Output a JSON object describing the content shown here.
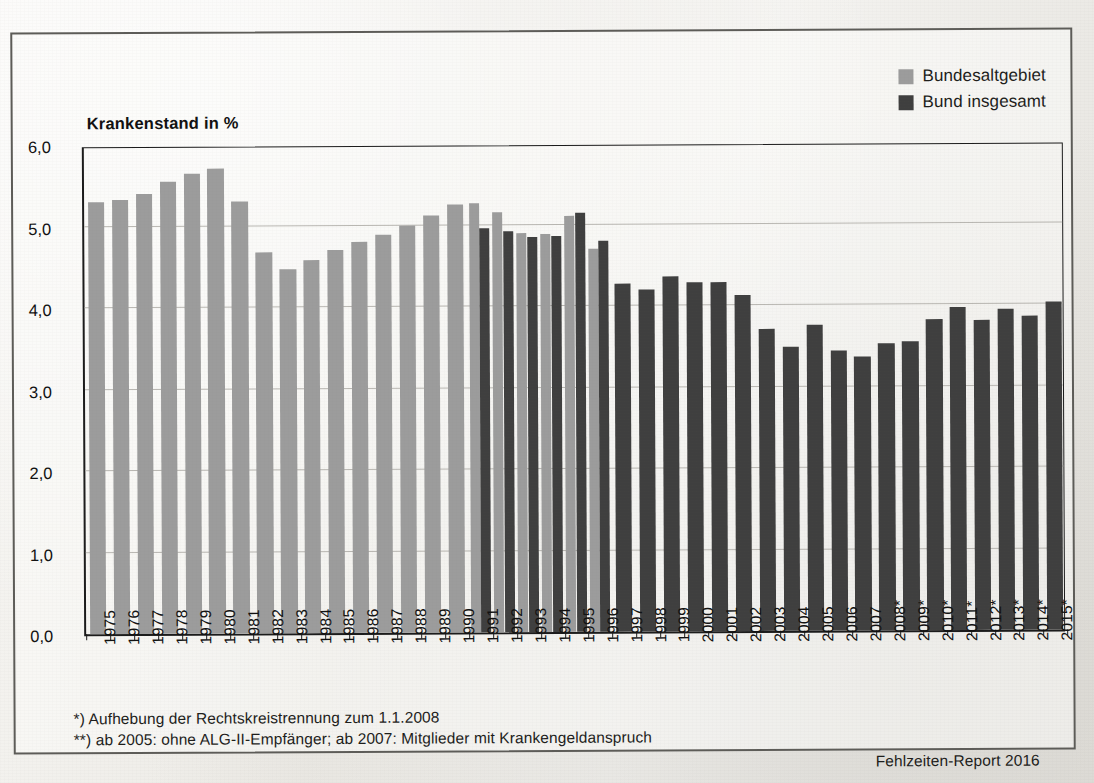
{
  "legend": {
    "items": [
      {
        "label": "Bundesaltgebiet",
        "color": "#9c9c9c"
      },
      {
        "label": "Bund insgesamt",
        "color": "#3f3f3f"
      }
    ]
  },
  "notes": [
    "*) Aufhebung der Rechtskreistrennung zum 1.1.2008",
    "**) ab 2005: ohne ALG-II-Empfänger; ab 2007: Mitglieder mit Krankengeldanspruch"
  ],
  "source": "Fehlzeiten-Report 2016",
  "chart_data": {
    "type": "bar",
    "title": "Krankenstand in %",
    "xlabel": "",
    "ylabel": "Krankenstand in %",
    "ylim": [
      0.0,
      6.0
    ],
    "ytick_labels": [
      "0,0",
      "1,0",
      "2,0",
      "3,0",
      "4,0",
      "5,0",
      "6,0"
    ],
    "yticks": [
      0.0,
      1.0,
      2.0,
      3.0,
      4.0,
      5.0,
      6.0
    ],
    "grid": true,
    "legend_position": "top-right",
    "categories": [
      "1975",
      "1976",
      "1977",
      "1978",
      "1979",
      "1980",
      "1981",
      "1982",
      "1983",
      "1984",
      "1985",
      "1986",
      "1987",
      "1988",
      "1989",
      "1990",
      "1991",
      "1992",
      "1993",
      "1994",
      "1995",
      "1996",
      "1997",
      "1998",
      "1999",
      "2000",
      "2001",
      "2002",
      "2003",
      "2004",
      "2005",
      "2006",
      "2007",
      "2008*",
      "2009*",
      "2010*",
      "2011*",
      "2012*",
      "2013*",
      "2014*",
      "2015*"
    ],
    "series": [
      {
        "name": "Bundesaltgebiet",
        "color": "#9c9c9c",
        "values": [
          5.3,
          5.33,
          5.4,
          5.55,
          5.65,
          5.7,
          5.3,
          4.67,
          4.47,
          4.58,
          4.7,
          4.8,
          4.88,
          5.0,
          5.12,
          5.25,
          5.27,
          5.15,
          4.9,
          4.88,
          5.1,
          4.7,
          null,
          null,
          null,
          null,
          null,
          null,
          null,
          null,
          null,
          null,
          null,
          null,
          null,
          null,
          null,
          null,
          null,
          null,
          null
        ]
      },
      {
        "name": "Bund insgesamt",
        "color": "#3f3f3f",
        "values": [
          null,
          null,
          null,
          null,
          null,
          null,
          null,
          null,
          null,
          null,
          null,
          null,
          null,
          null,
          null,
          null,
          4.96,
          4.92,
          4.85,
          4.86,
          5.14,
          4.8,
          4.27,
          4.2,
          4.35,
          4.28,
          4.28,
          4.12,
          3.71,
          3.49,
          3.76,
          3.44,
          3.36,
          3.52,
          3.55,
          3.82,
          3.96,
          3.8,
          3.94,
          3.85,
          4.03
        ]
      }
    ]
  }
}
